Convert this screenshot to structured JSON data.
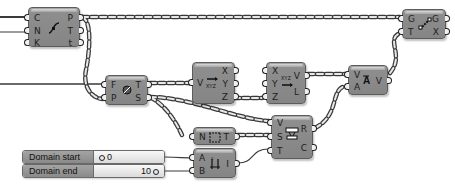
{
  "canvas": {
    "background": "#ffffff",
    "node_fill": "#888888",
    "wire_color": "#3a3a3a"
  },
  "nodes": [
    {
      "id": "curve-param",
      "inputs": [
        "C",
        "N",
        "K"
      ],
      "outputs": [
        "P",
        "T",
        "t"
      ],
      "icon": "divide-curve-icon"
    },
    {
      "id": "evaluate-frame",
      "inputs": [
        "F",
        "P"
      ],
      "outputs": [
        "T",
        "S"
      ],
      "icon": "plane-evaluate-icon"
    },
    {
      "id": "deconstruct-vector",
      "inputs": [
        "V"
      ],
      "outputs": [
        "X",
        "Y",
        "Z"
      ],
      "icon": "deconstruct-vector-icon"
    },
    {
      "id": "construct-vector",
      "inputs": [
        "X",
        "Y",
        "Z"
      ],
      "outputs": [
        "V",
        "L"
      ],
      "icon": "construct-vector-icon"
    },
    {
      "id": "amplitude",
      "inputs": [
        "V",
        "A"
      ],
      "outputs": [
        "V"
      ],
      "icon": "amplitude-icon"
    },
    {
      "id": "move",
      "inputs": [
        "G",
        "T"
      ],
      "outputs": [
        "G",
        "X"
      ],
      "icon": "move-icon"
    },
    {
      "id": "series",
      "inputs": [
        "N"
      ],
      "outputs": [
        "T"
      ],
      "icon": "series-icon"
    },
    {
      "id": "construct-domain",
      "inputs": [
        "A",
        "B"
      ],
      "outputs": [
        "I"
      ],
      "icon": "domain-icon"
    },
    {
      "id": "remap",
      "inputs": [
        "V",
        "S",
        "T"
      ],
      "outputs": [
        "R",
        "C"
      ],
      "icon": "remap-icon"
    }
  ],
  "sliders": [
    {
      "label": "Domain start",
      "value": "0",
      "value_align": "left"
    },
    {
      "label": "Domain end",
      "value": "10",
      "value_align": "right"
    }
  ]
}
